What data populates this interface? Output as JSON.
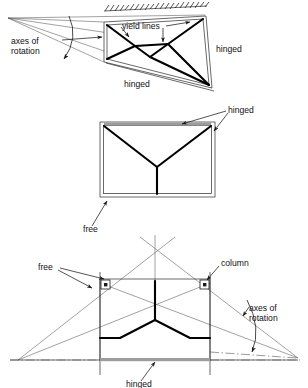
{
  "figure": {
    "panels": [
      {
        "id": "panel-top",
        "view": "perspective-trapezoid",
        "labels": [
          {
            "name": "axes-of-rotation",
            "line1": "axes of",
            "line2": "rotation",
            "x": 11,
            "y": 44
          },
          {
            "name": "yield-lines",
            "text": "yield lines",
            "x": 122,
            "y": 29
          },
          {
            "name": "hinged-right",
            "text": "hinged",
            "x": 216,
            "y": 52
          },
          {
            "name": "hinged-bottom",
            "text": "hinged",
            "x": 124,
            "y": 87
          }
        ],
        "supports": {
          "top": "fixed-hatched",
          "right": "hinged",
          "bottom": "hinged",
          "left": "free-edge"
        }
      },
      {
        "id": "panel-middle",
        "view": "elevation-rectangle",
        "labels": [
          {
            "name": "hinged",
            "text": "hinged",
            "x": 228,
            "y": 113
          },
          {
            "name": "free",
            "text": "free",
            "x": 86,
            "y": 229
          }
        ],
        "supports": {
          "top": "hinged",
          "left": "hinged",
          "right": "hinged",
          "bottom": "free"
        },
        "yield_pattern": "Y-fan"
      },
      {
        "id": "panel-bottom",
        "view": "elevation-rectangle-with-columns",
        "labels": [
          {
            "name": "free",
            "text": "free",
            "x": 41,
            "y": 270
          },
          {
            "name": "column",
            "text": "column",
            "x": 222,
            "y": 267
          },
          {
            "name": "axes-of-rotation",
            "line1": "axes of",
            "line2": "rotation",
            "x": 250,
            "y": 310
          },
          {
            "name": "hinged",
            "text": "hinged",
            "x": 130,
            "y": 385
          }
        ],
        "supports": {
          "bottom": "hinged",
          "top": "free",
          "left": "free",
          "right": "free",
          "point_supports": "columns"
        },
        "yield_pattern": "Y-fan-with-column-supports"
      }
    ],
    "colors": {
      "yield_line": "#000000",
      "outline": "#2a2a2a",
      "construction_line": "#555555",
      "support_band": "#9c9c9c",
      "text": "#111111",
      "background": "#ffffff"
    }
  }
}
